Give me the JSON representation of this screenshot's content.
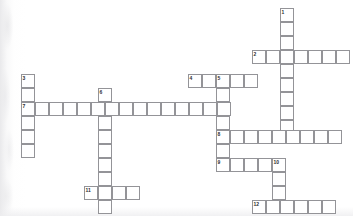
{
  "puzzle": {
    "title": "Crossword Puzzle Grid",
    "cell_size": 14,
    "grid_origin": {
      "x": 21,
      "y": 8
    },
    "colors": {
      "cell_border": "#949498",
      "cell_fill": "#ffffff",
      "number_text": "#2e2e30",
      "page_background": "#ffffff"
    },
    "entry_count": 12,
    "numbers_visible": [
      "1",
      "2",
      "3",
      "4",
      "5",
      "6",
      "7",
      "8",
      "9",
      "10",
      "11",
      "12"
    ],
    "entries": [
      {
        "number": "1",
        "direction": "down",
        "length": 9,
        "start": {
          "x": 280,
          "y": 8
        },
        "answer": ""
      },
      {
        "number": "2",
        "direction": "across",
        "length": 7,
        "start": {
          "x": 252,
          "y": 50
        },
        "answer": ""
      },
      {
        "number": "3",
        "direction": "down",
        "length": 6,
        "start": {
          "x": 21,
          "y": 74
        },
        "answer": ""
      },
      {
        "number": "4",
        "direction": "across",
        "length": 5,
        "start": {
          "x": 188,
          "y": 74
        },
        "answer": ""
      },
      {
        "number": "5",
        "direction": "down",
        "length": 7,
        "start": {
          "x": 216,
          "y": 74
        },
        "answer": ""
      },
      {
        "number": "6",
        "direction": "down",
        "length": 9,
        "start": {
          "x": 98,
          "y": 88
        },
        "answer": ""
      },
      {
        "number": "7",
        "direction": "across",
        "length": 15,
        "start": {
          "x": 21,
          "y": 102
        },
        "answer": ""
      },
      {
        "number": "8",
        "direction": "across",
        "length": 10,
        "start": {
          "x": 216,
          "y": 130
        },
        "answer": ""
      },
      {
        "number": "9",
        "direction": "across",
        "length": 5,
        "start": {
          "x": 216,
          "y": 158
        },
        "answer": ""
      },
      {
        "number": "10",
        "direction": "down",
        "length": 4,
        "start": {
          "x": 272,
          "y": 158
        },
        "answer": ""
      },
      {
        "number": "11",
        "direction": "across",
        "length": 4,
        "start": {
          "x": 84,
          "y": 186
        },
        "answer": ""
      },
      {
        "number": "12",
        "direction": "across",
        "length": 7,
        "start": {
          "x": 252,
          "y": 200
        },
        "answer": ""
      }
    ],
    "cells": [
      {
        "x": 280,
        "y": 8,
        "num": "1",
        "letter": ""
      },
      {
        "x": 280,
        "y": 22,
        "num": "",
        "letter": ""
      },
      {
        "x": 280,
        "y": 36,
        "num": "",
        "letter": ""
      },
      {
        "x": 252,
        "y": 50,
        "num": "2",
        "letter": ""
      },
      {
        "x": 266,
        "y": 50,
        "num": "",
        "letter": ""
      },
      {
        "x": 280,
        "y": 50,
        "num": "",
        "letter": ""
      },
      {
        "x": 294,
        "y": 50,
        "num": "",
        "letter": ""
      },
      {
        "x": 308,
        "y": 50,
        "num": "",
        "letter": ""
      },
      {
        "x": 322,
        "y": 50,
        "num": "",
        "letter": ""
      },
      {
        "x": 336,
        "y": 50,
        "num": "",
        "letter": ""
      },
      {
        "x": 280,
        "y": 64,
        "num": "",
        "letter": ""
      },
      {
        "x": 280,
        "y": 78,
        "num": "",
        "letter": ""
      },
      {
        "x": 280,
        "y": 92,
        "num": "",
        "letter": ""
      },
      {
        "x": 280,
        "y": 106,
        "num": "",
        "letter": ""
      },
      {
        "x": 280,
        "y": 120,
        "num": "",
        "letter": ""
      },
      {
        "x": 21,
        "y": 74,
        "num": "3",
        "letter": ""
      },
      {
        "x": 21,
        "y": 88,
        "num": "",
        "letter": ""
      },
      {
        "x": 188,
        "y": 74,
        "num": "4",
        "letter": ""
      },
      {
        "x": 202,
        "y": 74,
        "num": "",
        "letter": ""
      },
      {
        "x": 216,
        "y": 74,
        "num": "5",
        "letter": ""
      },
      {
        "x": 230,
        "y": 74,
        "num": "",
        "letter": ""
      },
      {
        "x": 244,
        "y": 74,
        "num": "",
        "letter": ""
      },
      {
        "x": 216,
        "y": 88,
        "num": "",
        "letter": ""
      },
      {
        "x": 98,
        "y": 88,
        "num": "6",
        "letter": ""
      },
      {
        "x": 21,
        "y": 102,
        "num": "7",
        "letter": ""
      },
      {
        "x": 35,
        "y": 102,
        "num": "",
        "letter": ""
      },
      {
        "x": 49,
        "y": 102,
        "num": "",
        "letter": ""
      },
      {
        "x": 63,
        "y": 102,
        "num": "",
        "letter": ""
      },
      {
        "x": 77,
        "y": 102,
        "num": "",
        "letter": ""
      },
      {
        "x": 91,
        "y": 102,
        "num": "",
        "letter": ""
      },
      {
        "x": 105,
        "y": 102,
        "num": "",
        "letter": ""
      },
      {
        "x": 119,
        "y": 102,
        "num": "",
        "letter": ""
      },
      {
        "x": 133,
        "y": 102,
        "num": "",
        "letter": ""
      },
      {
        "x": 147,
        "y": 102,
        "num": "",
        "letter": ""
      },
      {
        "x": 161,
        "y": 102,
        "num": "",
        "letter": ""
      },
      {
        "x": 175,
        "y": 102,
        "num": "",
        "letter": ""
      },
      {
        "x": 189,
        "y": 102,
        "num": "",
        "letter": ""
      },
      {
        "x": 203,
        "y": 102,
        "num": "",
        "letter": ""
      },
      {
        "x": 217,
        "y": 102,
        "num": "",
        "letter": ""
      },
      {
        "x": 21,
        "y": 116,
        "num": "",
        "letter": ""
      },
      {
        "x": 21,
        "y": 130,
        "num": "",
        "letter": ""
      },
      {
        "x": 21,
        "y": 144,
        "num": "",
        "letter": ""
      },
      {
        "x": 98,
        "y": 116,
        "num": "",
        "letter": ""
      },
      {
        "x": 98,
        "y": 130,
        "num": "",
        "letter": ""
      },
      {
        "x": 98,
        "y": 144,
        "num": "",
        "letter": ""
      },
      {
        "x": 98,
        "y": 158,
        "num": "",
        "letter": ""
      },
      {
        "x": 98,
        "y": 172,
        "num": "",
        "letter": ""
      },
      {
        "x": 98,
        "y": 186,
        "num": "",
        "letter": ""
      },
      {
        "x": 98,
        "y": 200,
        "num": "",
        "letter": ""
      },
      {
        "x": 216,
        "y": 116,
        "num": "",
        "letter": ""
      },
      {
        "x": 216,
        "y": 130,
        "num": "8",
        "letter": ""
      },
      {
        "x": 230,
        "y": 130,
        "num": "",
        "letter": ""
      },
      {
        "x": 244,
        "y": 130,
        "num": "",
        "letter": ""
      },
      {
        "x": 258,
        "y": 130,
        "num": "",
        "letter": ""
      },
      {
        "x": 272,
        "y": 130,
        "num": "",
        "letter": ""
      },
      {
        "x": 286,
        "y": 130,
        "num": "",
        "letter": ""
      },
      {
        "x": 300,
        "y": 130,
        "num": "",
        "letter": ""
      },
      {
        "x": 314,
        "y": 130,
        "num": "",
        "letter": ""
      },
      {
        "x": 328,
        "y": 130,
        "num": "",
        "letter": ""
      },
      {
        "x": 216,
        "y": 144,
        "num": "",
        "letter": ""
      },
      {
        "x": 216,
        "y": 158,
        "num": "9",
        "letter": ""
      },
      {
        "x": 230,
        "y": 158,
        "num": "",
        "letter": ""
      },
      {
        "x": 244,
        "y": 158,
        "num": "",
        "letter": ""
      },
      {
        "x": 258,
        "y": 158,
        "num": "",
        "letter": ""
      },
      {
        "x": 272,
        "y": 158,
        "num": "10",
        "letter": ""
      },
      {
        "x": 272,
        "y": 172,
        "num": "",
        "letter": ""
      },
      {
        "x": 272,
        "y": 186,
        "num": "",
        "letter": ""
      },
      {
        "x": 84,
        "y": 186,
        "num": "11",
        "letter": ""
      },
      {
        "x": 112,
        "y": 186,
        "num": "",
        "letter": ""
      },
      {
        "x": 126,
        "y": 186,
        "num": "",
        "letter": ""
      },
      {
        "x": 252,
        "y": 200,
        "num": "12",
        "letter": ""
      },
      {
        "x": 266,
        "y": 200,
        "num": "",
        "letter": ""
      },
      {
        "x": 280,
        "y": 200,
        "num": "",
        "letter": ""
      },
      {
        "x": 294,
        "y": 200,
        "num": "",
        "letter": ""
      },
      {
        "x": 308,
        "y": 200,
        "num": "",
        "letter": ""
      },
      {
        "x": 322,
        "y": 200,
        "num": "",
        "letter": ""
      }
    ]
  }
}
